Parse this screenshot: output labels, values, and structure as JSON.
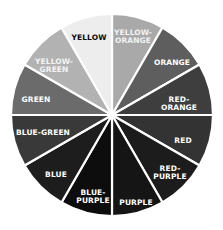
{
  "wheel": {
    "center": [
      112,
      115
    ],
    "radius": 101,
    "divider_color": "#ffffff",
    "segments": [
      {
        "label": "YELLOW-\nORANGE",
        "start": 0,
        "end": 30,
        "fill": "#a9a9a9",
        "text_color": "#f2f2f2",
        "label_pos": [
          133,
          37
        ]
      },
      {
        "label": "ORANGE",
        "start": 30,
        "end": 60,
        "fill": "#5e5e5e",
        "text_color": "#ffffff",
        "label_pos": [
          172,
          63
        ]
      },
      {
        "label": "RED-ORANGE",
        "start": 60,
        "end": 90,
        "fill": "#3e3e3e",
        "text_color": "#ffffff",
        "label_pos": [
          179,
          104
        ]
      },
      {
        "label": "RED",
        "start": 90,
        "end": 120,
        "fill": "#333333",
        "text_color": "#ffffff",
        "label_pos": [
          183,
          141
        ]
      },
      {
        "label": "RED-\nPURPLE",
        "start": 120,
        "end": 150,
        "fill": "#1c1c1c",
        "text_color": "#ffffff",
        "label_pos": [
          170,
          173
        ]
      },
      {
        "label": "PURPLE",
        "start": 150,
        "end": 180,
        "fill": "#151515",
        "text_color": "#ffffff",
        "label_pos": [
          136,
          203
        ]
      },
      {
        "label": "BLUE-\nPURPLE",
        "start": 180,
        "end": 210,
        "fill": "#0d0d0d",
        "text_color": "#ffffff",
        "label_pos": [
          93,
          197
        ]
      },
      {
        "label": "BLUE",
        "start": 210,
        "end": 240,
        "fill": "#1d1d1d",
        "text_color": "#ffffff",
        "label_pos": [
          56,
          175
        ]
      },
      {
        "label": "BLUE-GREEN",
        "start": 240,
        "end": 270,
        "fill": "#393939",
        "text_color": "#ffffff",
        "label_pos": [
          43,
          133
        ]
      },
      {
        "label": "GREEN",
        "start": 270,
        "end": 300,
        "fill": "#6b6b6b",
        "text_color": "#ffffff",
        "label_pos": [
          36,
          100
        ]
      },
      {
        "label": "YELLOW-\nGREEN",
        "start": 300,
        "end": 330,
        "fill": "#b2b2b2",
        "text_color": "#f4f4f4",
        "label_pos": [
          54,
          66
        ]
      },
      {
        "label": "YELLOW",
        "start": 330,
        "end": 360,
        "fill": "#ededed",
        "text_color": "#0a0a0a",
        "label_pos": [
          89,
          38
        ]
      }
    ]
  }
}
